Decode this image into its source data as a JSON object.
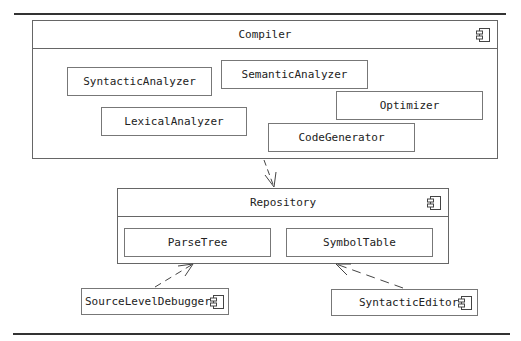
{
  "diagram": {
    "type": "UML component diagram",
    "compiler": {
      "title": "Compiler",
      "icon": "component-icon",
      "parts": [
        {
          "label": "SyntacticAnalyzer"
        },
        {
          "label": "SemanticAnalyzer"
        },
        {
          "label": "Optimizer"
        },
        {
          "label": "LexicalAnalyzer"
        },
        {
          "label": "CodeGenerator"
        }
      ]
    },
    "repository": {
      "title": "Repository",
      "icon": "component-icon",
      "parts": [
        {
          "label": "ParseTree"
        },
        {
          "label": "SymbolTable"
        }
      ]
    },
    "clients": [
      {
        "label": "SourceLevelDebugger",
        "icon": "component-icon"
      },
      {
        "label": "SyntacticEditor",
        "icon": "component-icon"
      }
    ],
    "dependencies": [
      {
        "from": "Compiler",
        "to": "Repository",
        "style": "dashed-open-arrow"
      },
      {
        "from": "SourceLevelDebugger",
        "to": "ParseTree",
        "style": "dashed-open-arrow"
      },
      {
        "from": "SyntacticEditor",
        "to": "SymbolTable",
        "style": "dashed-open-arrow"
      }
    ]
  }
}
